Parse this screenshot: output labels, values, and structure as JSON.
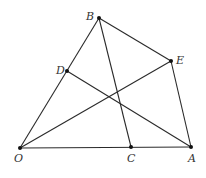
{
  "diagram": {
    "title": "",
    "points": {
      "O": {
        "label": "O",
        "x": 20,
        "y": 148,
        "lx": 14,
        "ly": 162
      },
      "A": {
        "label": "A",
        "x": 191,
        "y": 147,
        "lx": 188,
        "ly": 162
      },
      "C": {
        "label": "C",
        "x": 131,
        "y": 147,
        "lx": 127,
        "ly": 162
      },
      "B": {
        "label": "B",
        "x": 99,
        "y": 18,
        "lx": 86,
        "ly": 20
      },
      "E": {
        "label": "E",
        "x": 171,
        "y": 61,
        "lx": 176,
        "ly": 64
      },
      "D": {
        "label": "D",
        "x": 67,
        "y": 71,
        "lx": 56,
        "ly": 74
      }
    },
    "segments": [
      {
        "name": "segment-OB",
        "from": "O",
        "to": "B"
      },
      {
        "name": "segment-BE",
        "from": "B",
        "to": "E"
      },
      {
        "name": "segment-EA",
        "from": "E",
        "to": "A"
      },
      {
        "name": "segment-OA",
        "from": "O",
        "to": "A"
      },
      {
        "name": "segment-BC",
        "from": "B",
        "to": "C"
      },
      {
        "name": "segment-OE",
        "from": "O",
        "to": "E"
      },
      {
        "name": "segment-DA",
        "from": "D",
        "to": "A"
      }
    ],
    "colors": {
      "line": "#2a2a2a",
      "point": "#111111",
      "label": "#333333",
      "background": "#ffffff"
    }
  }
}
